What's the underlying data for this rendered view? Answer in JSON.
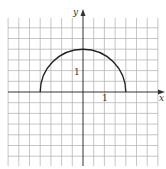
{
  "figure": {
    "axes": {
      "x_label": "x",
      "y_label": "y",
      "x_tick_label": "1",
      "y_tick_label": "1"
    },
    "colors": {
      "grid": "#b8b8b8",
      "axis": "#333333",
      "curve": "#222222"
    },
    "grid": {
      "origin_px": [
        83,
        92
      ],
      "cell_px": 10.7,
      "units_per_cell": 0.5,
      "x_cells_left": 7,
      "x_cells_right": 7,
      "y_cells_up": 6,
      "y_cells_down": 6
    },
    "curve": {
      "description": "upper semicircle",
      "equation": "y = sqrt(4 - x^2)",
      "center": [
        0,
        0
      ],
      "radius": 2,
      "x_range": [
        -2,
        2
      ]
    }
  },
  "chart_data": {
    "type": "line",
    "title": "",
    "xlabel": "x",
    "ylabel": "y",
    "xlim": [
      -3.5,
      3.7
    ],
    "ylim": [
      -3.4,
      3.8
    ],
    "grid": true,
    "tick_labels": {
      "x": [
        "1"
      ],
      "y": [
        "1"
      ]
    },
    "series": [
      {
        "name": "semicircle y = sqrt(4 - x^2)",
        "x": [
          -2,
          -1.5,
          -1,
          -0.5,
          0,
          0.5,
          1,
          1.5,
          2
        ],
        "y": [
          0,
          1.32,
          1.73,
          1.94,
          2,
          1.94,
          1.73,
          1.32,
          0
        ]
      }
    ]
  }
}
